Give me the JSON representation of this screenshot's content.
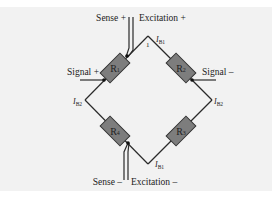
{
  "diagram": {
    "type": "wheatstone-bridge",
    "colors": {
      "background": "#f2f2f2",
      "wire": "#2a2a2a",
      "resistor_fill": "#7d7d7d",
      "resistor_stroke": "#333333"
    },
    "resistors": [
      {
        "id": "R1",
        "label": "R",
        "sub": "1"
      },
      {
        "id": "R2",
        "label": "R",
        "sub": "2"
      },
      {
        "id": "R3",
        "label": "R",
        "sub": "3"
      },
      {
        "id": "R4",
        "label": "R",
        "sub": "4"
      }
    ],
    "terminals": {
      "sense_plus": "Sense +",
      "excitation_plus": "Excitation +",
      "signal_plus": "Signal +",
      "signal_minus": "Signal –",
      "sense_minus": "Sense –",
      "excitation_minus": "Excitation –"
    },
    "currents": {
      "ib1_top": {
        "main": "I",
        "sub": "B1"
      },
      "ib1_bottom": {
        "main": "I",
        "sub": "B1"
      },
      "ib2_left": {
        "main": "I",
        "sub": "B2"
      },
      "ib2_right": {
        "main": "I",
        "sub": "B2"
      }
    },
    "node_label_top": "1"
  }
}
